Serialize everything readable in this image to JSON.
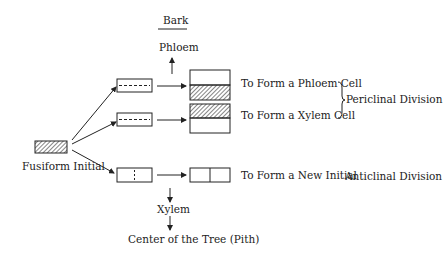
{
  "labels": {
    "bark": "Bark",
    "phloem": "Phloem",
    "fusiform_initial": "Fusiform Initial",
    "phloem_cell": "To Form a Phloem Cell",
    "xylem_cell": "To Form a Xylem Cell",
    "periclinal": "Periclinal Division",
    "new_initial": "To Form a New Initial",
    "anticlinal": "Anticlinal Division",
    "xylem": "Xylem",
    "center": "Center of the Tree (Pith)"
  },
  "colors": {
    "line": "#222222",
    "background": "#ffffff"
  }
}
